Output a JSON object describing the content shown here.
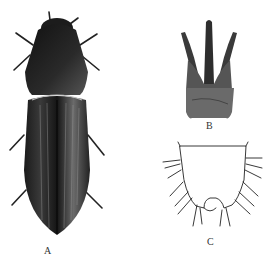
{
  "figure": {
    "panels": [
      {
        "id": "A",
        "label": "A",
        "content": "beetle-dorsal-view-photo"
      },
      {
        "id": "B",
        "label": "B",
        "content": "genitalia-photo"
      },
      {
        "id": "C",
        "label": "C",
        "content": "larval-segment-line-drawing"
      }
    ]
  }
}
